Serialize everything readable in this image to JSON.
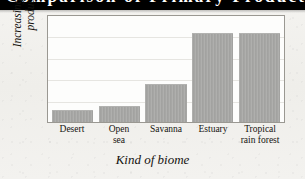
{
  "header": {
    "band_text": "Comparison of Primary Productivity",
    "note": "top black band text is clipped off-screen and illegible"
  },
  "chart_data": {
    "type": "bar",
    "title": "",
    "xlabel": "Kind of biome",
    "ylabel": "Increasing primary productivity",
    "categories": [
      "Desert",
      "Open\nsea",
      "Savanna",
      "Estuary",
      "Tropical\nrain forest"
    ],
    "values": [
      11,
      15,
      36,
      84,
      84
    ],
    "ylim": [
      0,
      100
    ],
    "xlim": null,
    "grid": true,
    "gridline_values": [
      20,
      40,
      60,
      80
    ],
    "legend": null,
    "axis_tick_labels_y": [],
    "annotations": [],
    "bar_color": "#a6a6a4",
    "plot_background": "#fdfdfc",
    "frame_color": "#9a9892"
  },
  "colors": {
    "page_background": "#f2f1ee",
    "band_background": "#000000",
    "band_text": "#ffffff",
    "text": "#15130f",
    "gridline": "#e6e5e1"
  }
}
